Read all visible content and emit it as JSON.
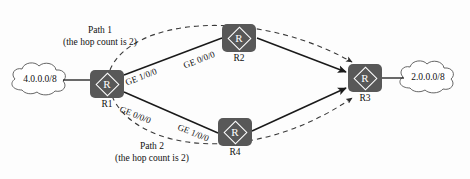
{
  "diagram": {
    "colors": {
      "router_fill": "#585858",
      "router_stroke": "#ffffff",
      "link_solid": "#1a1a1a",
      "link_dashed": "#4a4a4a",
      "cloud_stroke": "#555555",
      "text": "#111111",
      "background": "#fdfdfd"
    },
    "networks": [
      {
        "id": "net-left",
        "label": "4.0.0.0/8"
      },
      {
        "id": "net-right",
        "label": "2.0.0.0/8"
      }
    ],
    "routers": [
      {
        "id": "r1",
        "label": "R1",
        "glyph": "R"
      },
      {
        "id": "r2",
        "label": "R2",
        "glyph": "R"
      },
      {
        "id": "r3",
        "label": "R3",
        "glyph": "R"
      },
      {
        "id": "r4",
        "label": "R4",
        "glyph": "R"
      }
    ],
    "interfaces": [
      {
        "id": "if-r1-r2",
        "label": "GE 1/0/0",
        "on": "R1 toward R2"
      },
      {
        "id": "if-r2-r3",
        "label": "GE 0/0/0",
        "on": "R2 toward R3"
      },
      {
        "id": "if-r1-r4",
        "label": "GE 0/0/0",
        "on": "R1 toward R4"
      },
      {
        "id": "if-r4-r3",
        "label": "GE 1/0/0",
        "on": "R4 toward R3"
      }
    ],
    "paths": [
      {
        "id": "path-1",
        "name": "Path 1",
        "detail": "(the hop count is 2)"
      },
      {
        "id": "path-2",
        "name": "Path 2",
        "detail": "(the hop count is 2)"
      }
    ]
  }
}
